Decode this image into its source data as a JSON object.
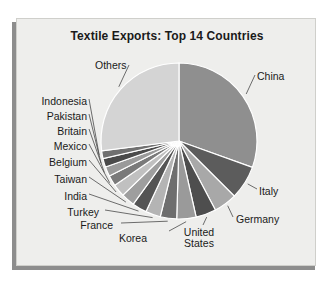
{
  "chart_data": {
    "type": "pie",
    "title": "Textile Exports: Top 14 Countries",
    "xlabel": "",
    "ylabel": "",
    "legend_position": "none",
    "labels_position": "outside-with-leader-lines",
    "grid": false,
    "categories": [
      "China",
      "Italy",
      "Germany",
      "United States",
      "Korea",
      "France",
      "Turkey",
      "India",
      "Taiwan",
      "Belgium",
      "Mexico",
      "Britain",
      "Pakistan",
      "Indonesia",
      "Others"
    ],
    "values": [
      30.5,
      7.0,
      4.8,
      4.2,
      4.0,
      3.4,
      3.1,
      3.0,
      2.8,
      2.6,
      2.2,
      2.0,
      1.8,
      1.6,
      27.0
    ],
    "unit": "percent of total textile exports",
    "slices": [
      {
        "label": "China",
        "value": 30.5,
        "color": "#8f8f8f",
        "start_angle": 0.0,
        "end_angle": 109.8
      },
      {
        "label": "Italy",
        "value": 7.0,
        "color": "#5c5c5c",
        "start_angle": 109.8,
        "end_angle": 134.9
      },
      {
        "label": "Germany",
        "value": 4.8,
        "color": "#a8a8a8",
        "start_angle": 134.9,
        "end_angle": 152.2
      },
      {
        "label": "United States",
        "value": 4.2,
        "color": "#4e4e4e",
        "start_angle": 152.2,
        "end_angle": 167.3
      },
      {
        "label": "Korea",
        "value": 4.0,
        "color": "#9a9a9a",
        "start_angle": 167.3,
        "end_angle": 181.7
      },
      {
        "label": "France",
        "value": 3.4,
        "color": "#6e6e6e",
        "start_angle": 181.7,
        "end_angle": 193.9
      },
      {
        "label": "Turkey",
        "value": 3.1,
        "color": "#b4b4b4",
        "start_angle": 193.9,
        "end_angle": 205.1
      },
      {
        "label": "India",
        "value": 3.0,
        "color": "#545454",
        "start_angle": 205.1,
        "end_angle": 215.9
      },
      {
        "label": "Taiwan",
        "value": 2.8,
        "color": "#9e9e9e",
        "start_angle": 215.9,
        "end_angle": 226.0
      },
      {
        "label": "Belgium",
        "value": 2.6,
        "color": "#c0c0c0",
        "start_angle": 226.0,
        "end_angle": 235.4
      },
      {
        "label": "Mexico",
        "value": 2.2,
        "color": "#7a7a7a",
        "start_angle": 235.4,
        "end_angle": 243.3
      },
      {
        "label": "Britain",
        "value": 2.0,
        "color": "#9a9a9a",
        "start_angle": 243.3,
        "end_angle": 250.5
      },
      {
        "label": "Pakistan",
        "value": 1.8,
        "color": "#4a4a4a",
        "start_angle": 250.5,
        "end_angle": 257.0
      },
      {
        "label": "Indonesia",
        "value": 1.6,
        "color": "#707070",
        "start_angle": 257.0,
        "end_angle": 262.8
      },
      {
        "label": "Others",
        "value": 27.0,
        "color": "#d4d4d4",
        "start_angle": 262.8,
        "end_angle": 360.0
      }
    ],
    "colors": {
      "panel_background": "#eeeeec",
      "page_background": "#ffffff",
      "frame_shadow": "#8d8d8d",
      "text": "#1a1a1a",
      "slice_divider": "#ffffff"
    }
  },
  "labels": {
    "china": "China",
    "italy": "Italy",
    "germany": "Germany",
    "united_states_line1": "United",
    "united_states_line2": "States",
    "korea": "Korea",
    "france": "France",
    "turkey": "Turkey",
    "india": "India",
    "taiwan": "Taiwan",
    "belgium": "Belgium",
    "mexico": "Mexico",
    "britain": "Britain",
    "pakistan": "Pakistan",
    "indonesia": "Indonesia",
    "others": "Others"
  }
}
